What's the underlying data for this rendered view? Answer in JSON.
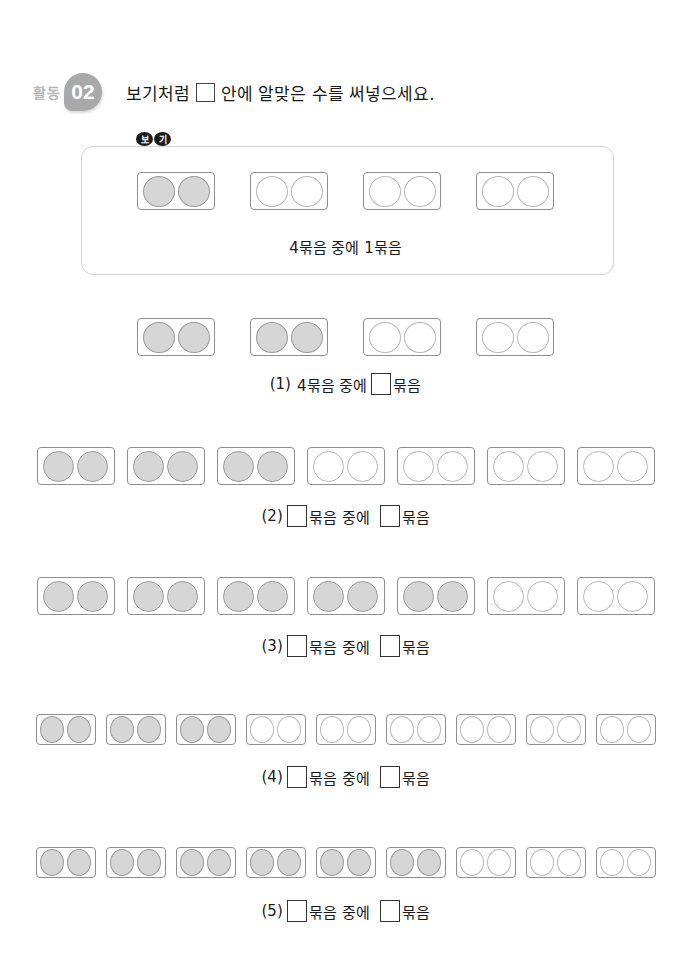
{
  "header": {
    "activity_label": "활동",
    "activity_number": "02",
    "instruction_before": "보기처럼",
    "instruction_after": "안에 알맞은 수를 써넣으세요."
  },
  "example": {
    "tag": [
      "보",
      "기"
    ],
    "groups": [
      true,
      false,
      false,
      false
    ],
    "caption": "4묶음 중에 1묶음"
  },
  "problems": [
    {
      "number": "(1)",
      "groups": [
        true,
        true,
        false,
        false
      ],
      "total_given": "4묶음 중에",
      "unit": "묶음",
      "text_between": "묶음 중에"
    },
    {
      "number": "(2)",
      "groups": [
        true,
        true,
        true,
        false,
        false,
        false,
        false
      ],
      "unit": "묶음",
      "text_between": "묶음 중에"
    },
    {
      "number": "(3)",
      "groups": [
        true,
        true,
        true,
        true,
        true,
        false,
        false
      ],
      "unit": "묶음",
      "text_between": "묶음 중에"
    },
    {
      "number": "(4)",
      "groups": [
        true,
        true,
        true,
        false,
        false,
        false,
        false,
        false,
        false
      ],
      "unit": "묶음",
      "text_between": "묶음 중에"
    },
    {
      "number": "(5)",
      "groups": [
        true,
        true,
        true,
        true,
        true,
        true,
        false,
        false,
        false
      ],
      "unit": "묶음",
      "text_between": "묶음 중에"
    }
  ],
  "colors": {
    "filled_dot": "#d6d6d6",
    "group_border": "#8e8e8e",
    "badge": "#a9a9a9",
    "example_border": "#d3d3d3"
  }
}
